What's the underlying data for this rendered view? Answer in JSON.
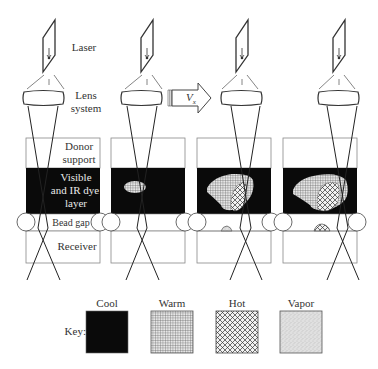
{
  "labels": {
    "laser": "Laser",
    "lens_line1": "Lens",
    "lens_line2": "system",
    "donor_line1": "Donor",
    "donor_line2": "support",
    "dye_line1": "Visible",
    "dye_line2": "and IR dye",
    "dye_line3": "layer",
    "bead_gap": "Bead gap",
    "receiver": "Receiver",
    "velocity": "V",
    "velocity_sub": "x"
  },
  "key": {
    "title": "Key:",
    "items": [
      {
        "label": "Cool",
        "pattern": "solid-black"
      },
      {
        "label": "Warm",
        "pattern": "fine-grid"
      },
      {
        "label": "Hot",
        "pattern": "crosshatch"
      },
      {
        "label": "Vapor",
        "pattern": "stipple"
      }
    ]
  },
  "panels": [
    {
      "stage": 1,
      "heated_region": "none"
    },
    {
      "stage": 2,
      "heated_region": "small warm spot"
    },
    {
      "stage": 3,
      "heated_region": "large warm region with hot core, small vapor droplet on receiver"
    },
    {
      "stage": 4,
      "heated_region": "larger warm region with hot core, larger droplet on receiver"
    }
  ],
  "colors": {
    "line": "#333333",
    "dye_layer": "#0a0a0a",
    "box_border": "#777777"
  }
}
